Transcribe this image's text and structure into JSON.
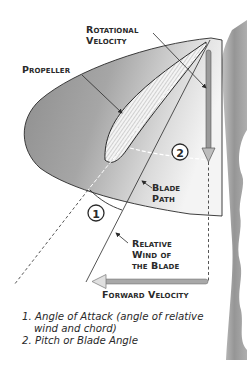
{
  "labels": {
    "rotational_velocity": [
      "Rotational",
      "Velocity"
    ],
    "propeller": "Propeller",
    "blade_path": [
      "Blade",
      "Path"
    ],
    "relative_wind": [
      "Relative",
      "Wind of",
      "the Blade"
    ],
    "forward_velocity": "Forward Velocity"
  },
  "angle_markers": [
    "1",
    "2"
  ],
  "legend": [
    {
      "num": "1.",
      "text": "Angle of Attack (angle of relative",
      "cont": "wind and chord)"
    },
    {
      "num": "2.",
      "text": "Pitch or Blade Angle"
    }
  ],
  "colors": {
    "disc_fill": "#9a9a9a",
    "disc_light": "#e8e8e8",
    "arrow_fill": "#a8a8a8",
    "line": "#2a2a2a",
    "hub": "#8f8f8f"
  }
}
